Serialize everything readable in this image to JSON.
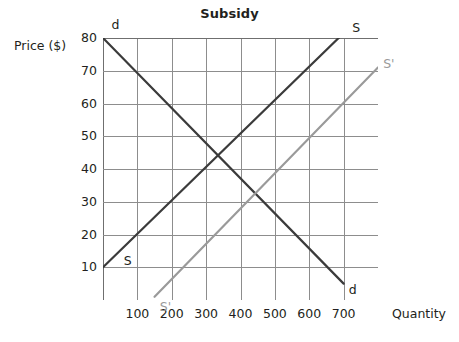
{
  "chart_data": {
    "type": "line",
    "title": "Subsidy",
    "xlabel": "Quantity",
    "ylabel": "Price ($)",
    "xlim": [
      0,
      800
    ],
    "ylim": [
      0,
      80
    ],
    "grid": true,
    "grid_x_step": 100,
    "grid_y_step": 10,
    "x_ticks": [
      100,
      200,
      300,
      400,
      500,
      600,
      700
    ],
    "x_tick_labels": [
      "100",
      "200",
      "300",
      "400",
      "500",
      "600",
      "700"
    ],
    "y_ticks": [
      10,
      20,
      30,
      40,
      50,
      60,
      70,
      80
    ],
    "y_tick_labels": [
      "10",
      "20",
      "30",
      "40",
      "50",
      "60",
      "70",
      "80"
    ],
    "legend": "inline-endpoint-labels",
    "series": [
      {
        "name": "d",
        "role": "demand",
        "color": "#3b3b3b",
        "points": [
          [
            0,
            80
          ],
          [
            700,
            5
          ]
        ],
        "start_label": "d",
        "end_label": "d"
      },
      {
        "name": "S",
        "role": "supply",
        "color": "#3b3b3b",
        "points": [
          [
            0,
            10
          ],
          [
            705,
            82
          ]
        ],
        "start_label": "S",
        "end_label": "S"
      },
      {
        "name": "S'",
        "role": "supply-after-subsidy",
        "color": "#9a9a9a",
        "points": [
          [
            150,
            1
          ],
          [
            800,
            71
          ]
        ],
        "start_label": "S'",
        "end_label": "S'"
      }
    ],
    "annotations": [
      {
        "text": "d",
        "x": 25,
        "y": 84,
        "series": "d",
        "position": "top-left"
      },
      {
        "text": "d",
        "x": 715,
        "y": 3,
        "series": "d",
        "position": "bottom-right"
      },
      {
        "text": "S",
        "x": 60,
        "y": 12,
        "series": "S",
        "position": "bottom-left"
      },
      {
        "text": "S",
        "x": 725,
        "y": 83,
        "series": "S",
        "position": "top-right"
      },
      {
        "text": "S'",
        "x": 165,
        "y": -2,
        "series": "S'",
        "position": "bottom-left"
      },
      {
        "text": "S'",
        "x": 815,
        "y": 72,
        "series": "S'",
        "position": "top-right"
      }
    ]
  },
  "colors": {
    "background": "#ffffff",
    "grid": "#8d8d8d",
    "axis": "#6f6f6f",
    "dark_curve": "#3b3b3b",
    "gray_curve": "#9a9a9a",
    "text": "#231f20"
  }
}
